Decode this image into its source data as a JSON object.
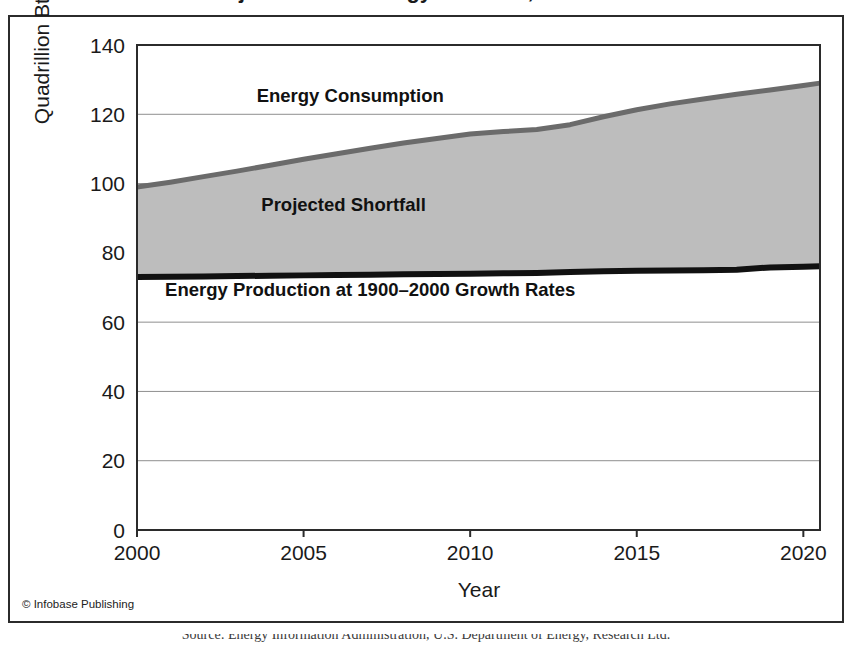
{
  "figure": {
    "title_cut_off": "Projected U.S. Energy Shortfall, 2000–2020",
    "copyright": "© Infobase Publishing",
    "caption_cut_off": "Source: Energy Information Administration, U.S. Department of Energy, Research Ltd."
  },
  "chart_data": {
    "type": "area",
    "title": "",
    "xlabel": "Year",
    "ylabel": "Quadrillion Btus",
    "xlim": [
      2000,
      2020.5
    ],
    "ylim": [
      0,
      140
    ],
    "xticks": [
      "2000",
      "2005",
      "2010",
      "2015",
      "2020"
    ],
    "xtick_values": [
      2000,
      2005,
      2010,
      2015,
      2020
    ],
    "yticks": [
      "0",
      "20",
      "40",
      "60",
      "80",
      "100",
      "120",
      "140"
    ],
    "ytick_values": [
      0,
      20,
      40,
      60,
      80,
      100,
      120,
      140
    ],
    "grid": "horizontal",
    "legend_position": "inline-annotations",
    "x": [
      2000,
      2001,
      2002,
      2003,
      2004,
      2005,
      2006,
      2007,
      2008,
      2009,
      2010,
      2011,
      2012,
      2013,
      2014,
      2015,
      2016,
      2017,
      2018,
      2019,
      2020,
      2020.5
    ],
    "series": [
      {
        "name": "Energy Consumption",
        "color": "#6b6b6b",
        "values": [
          99.0,
          100.4,
          102.0,
          103.6,
          105.3,
          107.0,
          108.6,
          110.2,
          111.7,
          113.0,
          114.3,
          115.0,
          115.6,
          117.0,
          119.3,
          121.3,
          123.0,
          124.4,
          125.8,
          127.0,
          128.3,
          129.0
        ]
      },
      {
        "name": "Energy Production at 1900–2000 Growth Rates",
        "color": "#111111",
        "values": [
          73.0,
          73.1,
          73.2,
          73.3,
          73.4,
          73.5,
          73.6,
          73.7,
          73.8,
          73.9,
          74.0,
          74.1,
          74.2,
          74.5,
          74.7,
          74.8,
          74.9,
          75.0,
          75.1,
          75.8,
          76.0,
          76.1
        ]
      }
    ],
    "fill_between": {
      "name": "Projected Shortfall",
      "color": "#bdbdbd",
      "upper_series": "Energy Consumption",
      "lower_series": "Energy Production at 1900–2000 Growth Rates"
    },
    "annotations": [
      {
        "text": "Energy Consumption",
        "x": 2006.4,
        "y": 123.5
      },
      {
        "text": "Projected Shortfall",
        "x": 2006.2,
        "y": 92.0
      },
      {
        "text": "Energy Production at 1900–2000 Growth Rates",
        "x": 2007.0,
        "y": 67.5
      }
    ]
  }
}
